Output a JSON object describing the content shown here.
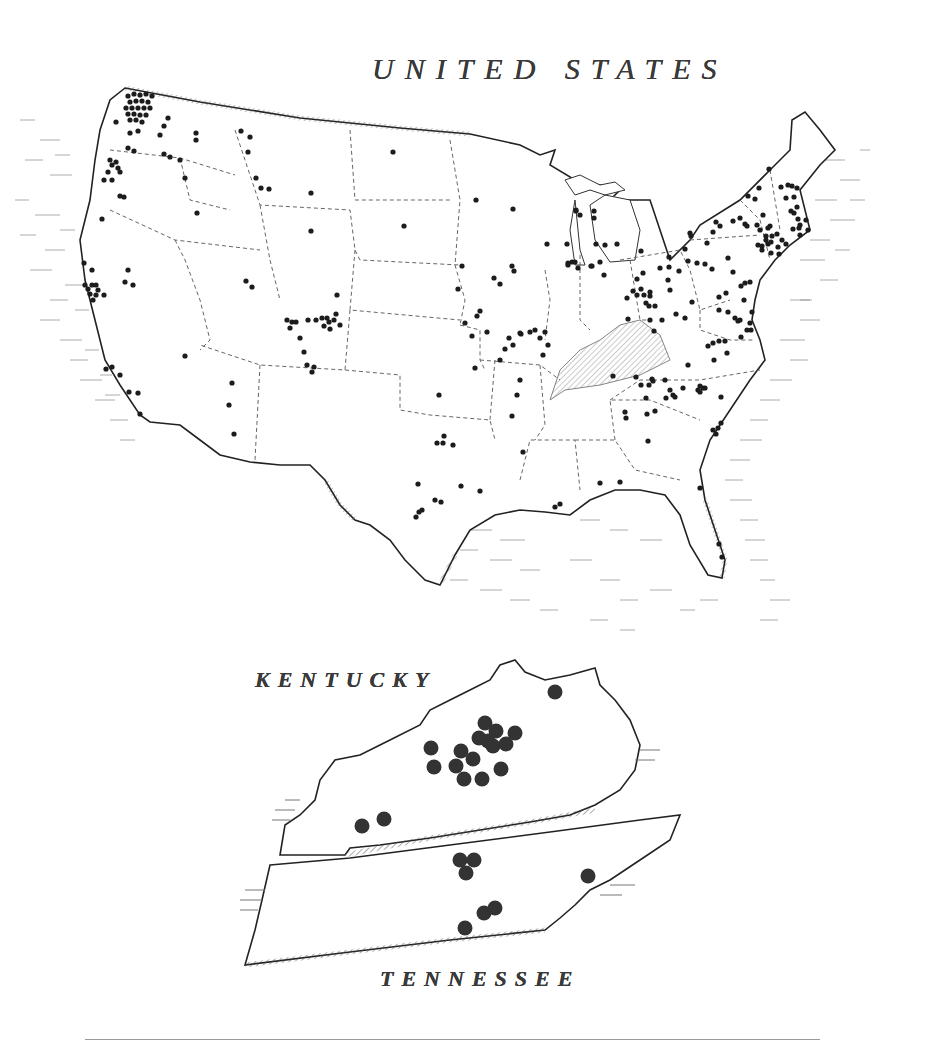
{
  "titles": {
    "us": "UNITED STATES",
    "kentucky": "KENTUCKY",
    "tennessee": "TENNESSEE"
  },
  "colors": {
    "ink": "#222222",
    "dot": "#1c1c1c",
    "inset_dot": "#333333",
    "border_dash": "#666666",
    "hatch": "#555555",
    "background": "#ffffff"
  },
  "us_map": {
    "dots": [
      [
        128,
        96
      ],
      [
        134,
        94
      ],
      [
        140,
        95
      ],
      [
        146,
        94
      ],
      [
        152,
        96
      ],
      [
        130,
        102
      ],
      [
        136,
        101
      ],
      [
        142,
        101
      ],
      [
        148,
        102
      ],
      [
        126,
        108
      ],
      [
        132,
        108
      ],
      [
        138,
        108
      ],
      [
        144,
        108
      ],
      [
        150,
        108
      ],
      [
        128,
        114
      ],
      [
        134,
        114
      ],
      [
        140,
        115
      ],
      [
        146,
        115
      ],
      [
        130,
        120
      ],
      [
        136,
        120
      ],
      [
        142,
        122
      ],
      [
        116,
        122
      ],
      [
        130,
        133
      ],
      [
        138,
        131
      ],
      [
        168,
        118
      ],
      [
        164,
        126
      ],
      [
        160,
        135
      ],
      [
        196,
        133
      ],
      [
        196,
        140
      ],
      [
        128,
        148
      ],
      [
        134,
        151
      ],
      [
        164,
        154
      ],
      [
        170,
        157
      ],
      [
        180,
        160
      ],
      [
        185,
        178
      ],
      [
        197,
        213
      ],
      [
        110,
        160
      ],
      [
        112,
        165
      ],
      [
        116,
        162
      ],
      [
        118,
        168
      ],
      [
        108,
        172
      ],
      [
        120,
        172
      ],
      [
        104,
        180
      ],
      [
        112,
        180
      ],
      [
        120,
        196
      ],
      [
        124,
        197
      ],
      [
        102,
        219
      ],
      [
        241,
        131
      ],
      [
        250,
        137
      ],
      [
        248,
        152
      ],
      [
        256,
        178
      ],
      [
        261,
        188
      ],
      [
        269,
        189
      ],
      [
        311,
        193
      ],
      [
        311,
        231
      ],
      [
        393,
        152
      ],
      [
        404,
        226
      ],
      [
        84,
        263
      ],
      [
        92,
        270
      ],
      [
        85,
        285
      ],
      [
        88,
        289
      ],
      [
        92,
        285
      ],
      [
        96,
        285
      ],
      [
        98,
        290
      ],
      [
        90,
        294
      ],
      [
        96,
        295
      ],
      [
        93,
        300
      ],
      [
        104,
        295
      ],
      [
        128,
        270
      ],
      [
        125,
        282
      ],
      [
        133,
        285
      ],
      [
        246,
        281
      ],
      [
        252,
        287
      ],
      [
        185,
        356
      ],
      [
        287,
        320
      ],
      [
        292,
        322
      ],
      [
        296,
        322
      ],
      [
        290,
        328
      ],
      [
        300,
        338
      ],
      [
        308,
        320
      ],
      [
        316,
        320
      ],
      [
        322,
        318
      ],
      [
        327,
        318
      ],
      [
        329,
        322
      ],
      [
        334,
        320
      ],
      [
        336,
        314
      ],
      [
        324,
        326
      ],
      [
        330,
        329
      ],
      [
        337,
        295
      ],
      [
        340,
        325
      ],
      [
        304,
        352
      ],
      [
        307,
        365
      ],
      [
        312,
        372
      ],
      [
        314,
        367
      ],
      [
        232,
        383
      ],
      [
        229,
        405
      ],
      [
        234,
        434
      ],
      [
        106,
        369
      ],
      [
        112,
        367
      ],
      [
        129,
        392
      ],
      [
        138,
        393
      ],
      [
        140,
        414
      ],
      [
        120,
        375
      ],
      [
        439,
        395
      ],
      [
        444,
        436
      ],
      [
        437,
        443
      ],
      [
        443,
        443
      ],
      [
        453,
        445
      ],
      [
        418,
        484
      ],
      [
        461,
        486
      ],
      [
        480,
        491
      ],
      [
        435,
        500
      ],
      [
        441,
        502
      ],
      [
        416,
        517
      ],
      [
        419,
        512
      ],
      [
        422,
        510
      ],
      [
        477,
        316
      ],
      [
        487,
        332
      ],
      [
        472,
        336
      ],
      [
        509,
        338
      ],
      [
        521,
        334
      ],
      [
        530,
        332
      ],
      [
        535,
        330
      ],
      [
        540,
        338
      ],
      [
        545,
        332
      ],
      [
        548,
        345
      ],
      [
        543,
        355
      ],
      [
        513,
        345
      ],
      [
        505,
        349
      ],
      [
        500,
        360
      ],
      [
        475,
        368
      ],
      [
        465,
        323
      ],
      [
        480,
        311
      ],
      [
        462,
        266
      ],
      [
        458,
        289
      ],
      [
        494,
        278
      ],
      [
        500,
        284
      ],
      [
        512,
        266
      ],
      [
        514,
        271
      ],
      [
        520,
        333
      ],
      [
        476,
        200
      ],
      [
        513,
        209
      ],
      [
        547,
        244
      ],
      [
        567,
        244
      ],
      [
        576,
        211
      ],
      [
        580,
        215
      ],
      [
        594,
        211
      ],
      [
        594,
        218
      ],
      [
        596,
        244
      ],
      [
        605,
        245
      ],
      [
        617,
        244
      ],
      [
        641,
        251
      ],
      [
        568,
        263
      ],
      [
        572,
        262
      ],
      [
        568,
        265
      ],
      [
        575,
        262
      ],
      [
        578,
        268
      ],
      [
        591,
        266
      ],
      [
        592,
        266
      ],
      [
        600,
        262
      ],
      [
        604,
        275
      ],
      [
        637,
        279
      ],
      [
        643,
        273
      ],
      [
        660,
        268
      ],
      [
        669,
        267
      ],
      [
        576,
        210
      ],
      [
        627,
        298
      ],
      [
        633,
        291
      ],
      [
        637,
        295
      ],
      [
        641,
        289
      ],
      [
        644,
        295
      ],
      [
        650,
        296
      ],
      [
        650,
        292
      ],
      [
        646,
        303
      ],
      [
        649,
        306
      ],
      [
        655,
        306
      ],
      [
        628,
        319
      ],
      [
        650,
        320
      ],
      [
        654,
        331
      ],
      [
        662,
        320
      ],
      [
        668,
        280
      ],
      [
        679,
        271
      ],
      [
        670,
        290
      ],
      [
        676,
        314
      ],
      [
        685,
        318
      ],
      [
        692,
        302
      ],
      [
        719,
        310
      ],
      [
        728,
        312
      ],
      [
        719,
        341
      ],
      [
        725,
        341
      ],
      [
        735,
        318
      ],
      [
        740,
        320
      ],
      [
        738,
        321
      ],
      [
        744,
        300
      ],
      [
        719,
        297
      ],
      [
        750,
        323
      ],
      [
        741,
        337
      ],
      [
        752,
        312
      ],
      [
        751,
        330
      ],
      [
        747,
        330
      ],
      [
        727,
        353
      ],
      [
        708,
        346
      ],
      [
        713,
        343
      ],
      [
        652,
        379
      ],
      [
        665,
        380
      ],
      [
        649,
        385
      ],
      [
        653,
        381
      ],
      [
        670,
        390
      ],
      [
        675,
        397
      ],
      [
        666,
        398
      ],
      [
        673,
        395
      ],
      [
        683,
        388
      ],
      [
        713,
        430
      ],
      [
        716,
        434
      ],
      [
        721,
        423
      ],
      [
        718,
        428
      ],
      [
        698,
        390
      ],
      [
        703,
        388
      ],
      [
        705,
        388
      ],
      [
        721,
        397
      ],
      [
        688,
        365
      ],
      [
        714,
        360
      ],
      [
        700,
        386
      ],
      [
        700,
        392
      ],
      [
        620,
        482
      ],
      [
        636,
        377
      ],
      [
        655,
        411
      ],
      [
        648,
        441
      ],
      [
        647,
        414
      ],
      [
        641,
        385
      ],
      [
        613,
        376
      ],
      [
        646,
        398
      ],
      [
        625,
        412
      ],
      [
        626,
        418
      ],
      [
        722,
        557
      ],
      [
        719,
        544
      ],
      [
        700,
        488
      ],
      [
        600,
        483
      ],
      [
        555,
        507
      ],
      [
        560,
        504
      ],
      [
        523,
        452
      ],
      [
        512,
        416
      ],
      [
        520,
        380
      ],
      [
        517,
        395
      ],
      [
        690,
        233
      ],
      [
        716,
        222
      ],
      [
        720,
        226
      ],
      [
        707,
        243
      ],
      [
        733,
        221
      ],
      [
        740,
        218
      ],
      [
        745,
        224
      ],
      [
        747,
        226
      ],
      [
        757,
        225
      ],
      [
        760,
        230
      ],
      [
        766,
        236
      ],
      [
        772,
        236
      ],
      [
        770,
        226
      ],
      [
        777,
        234
      ],
      [
        768,
        244
      ],
      [
        782,
        240
      ],
      [
        786,
        244
      ],
      [
        778,
        247
      ],
      [
        771,
        253
      ],
      [
        800,
        235
      ],
      [
        808,
        230
      ],
      [
        794,
        213
      ],
      [
        786,
        198
      ],
      [
        794,
        197
      ],
      [
        791,
        211
      ],
      [
        797,
        207
      ],
      [
        798,
        219
      ],
      [
        806,
        220
      ],
      [
        799,
        228
      ],
      [
        800,
        225
      ],
      [
        793,
        229
      ],
      [
        748,
        196
      ],
      [
        755,
        199
      ],
      [
        763,
        215
      ],
      [
        768,
        228
      ],
      [
        771,
        242
      ],
      [
        779,
        254
      ],
      [
        759,
        188
      ],
      [
        769,
        169
      ],
      [
        788,
        185
      ],
      [
        781,
        187
      ],
      [
        691,
        236
      ],
      [
        713,
        232
      ],
      [
        685,
        249
      ],
      [
        688,
        261
      ],
      [
        697,
        263
      ],
      [
        705,
        264
      ],
      [
        712,
        269
      ],
      [
        726,
        293
      ],
      [
        741,
        286
      ],
      [
        745,
        283
      ],
      [
        750,
        282
      ],
      [
        728,
        258
      ],
      [
        733,
        272
      ],
      [
        762,
        246
      ],
      [
        766,
        240
      ],
      [
        762,
        250
      ],
      [
        758,
        245
      ],
      [
        792,
        186
      ],
      [
        797,
        188
      ],
      [
        669,
        257
      ]
    ]
  },
  "inset": {
    "kentucky_dots": [
      [
        485,
        723
      ],
      [
        496,
        731
      ],
      [
        515,
        733
      ],
      [
        479,
        738
      ],
      [
        506,
        744
      ],
      [
        461,
        751
      ],
      [
        493,
        746
      ],
      [
        488,
        741
      ],
      [
        473,
        759
      ],
      [
        456,
        766
      ],
      [
        431,
        748
      ],
      [
        434,
        767
      ],
      [
        464,
        779
      ],
      [
        482,
        779
      ],
      [
        501,
        769
      ],
      [
        555,
        692
      ],
      [
        362,
        826
      ],
      [
        384,
        819
      ]
    ],
    "tennessee_dots": [
      [
        460,
        860
      ],
      [
        474,
        860
      ],
      [
        466,
        873
      ],
      [
        588,
        876
      ],
      [
        484,
        913
      ],
      [
        495,
        908
      ],
      [
        465,
        928
      ]
    ]
  }
}
